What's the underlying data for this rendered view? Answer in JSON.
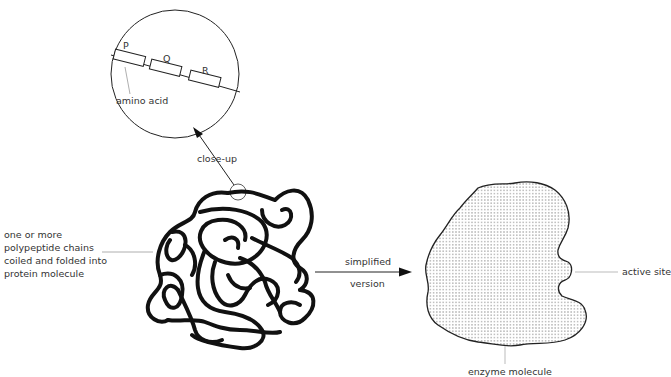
{
  "closeup": {
    "residues": [
      "P",
      "Q",
      "R"
    ],
    "amino_acid_label": "amino acid",
    "arrow_label": "close-up"
  },
  "protein": {
    "label_lines": [
      "one or more",
      "polypeptide chains",
      "coiled and folded into",
      "protein molecule"
    ]
  },
  "arrow": {
    "top_label": "simplified",
    "bottom_label": "version"
  },
  "enzyme": {
    "active_site_label": "active site",
    "molecule_label": "enzyme molecule"
  },
  "colors": {
    "line": "#111111",
    "leader": "#999999",
    "text": "#333333"
  }
}
